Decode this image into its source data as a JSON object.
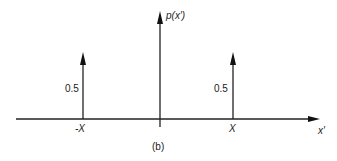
{
  "diagram": {
    "y_axis_label": "p(x′)",
    "x_axis_label": "x′",
    "caption": "(b)",
    "impulses": [
      {
        "position_label": "-X",
        "height_label": "0.5",
        "position": -1,
        "weight": 0.5
      },
      {
        "position_label": "X",
        "height_label": "0.5",
        "position": 1,
        "weight": 0.5
      }
    ]
  }
}
